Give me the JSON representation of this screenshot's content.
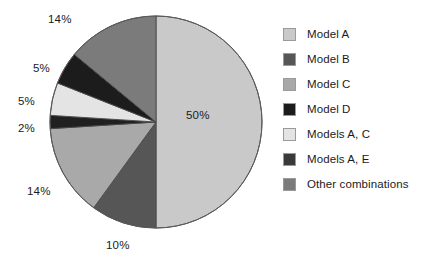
{
  "chart_data": {
    "type": "pie",
    "title": "",
    "subtitle": "",
    "xlabel": "",
    "ylabel": "",
    "grid": false,
    "legend_position": "right",
    "start_angle_deg": 0,
    "direction": "clockwise",
    "categories": [
      "Model A",
      "Model B",
      "Model C",
      "Models A, E",
      "Models A, C",
      "Model D",
      "Other combinations"
    ],
    "values": [
      50,
      10,
      14,
      2,
      5,
      5,
      14
    ],
    "data_labels": [
      "50%",
      "10%",
      "14%",
      "2%",
      "5%",
      "5%",
      "14%"
    ],
    "colors": [
      "#c9c9c9",
      "#565656",
      "#a9a9a9",
      "#202020",
      "#e4e4e4",
      "#1c1c1c",
      "#7b7b7b"
    ],
    "slices": [
      {
        "label": "Model A",
        "value": 50,
        "display": "50%",
        "color": "#c9c9c9"
      },
      {
        "label": "Model B",
        "value": 10,
        "display": "10%",
        "color": "#565656"
      },
      {
        "label": "Model C",
        "value": 14,
        "display": "14%",
        "color": "#a9a9a9"
      },
      {
        "label": "Models A, E",
        "value": 2,
        "display": "2%",
        "color": "#202020"
      },
      {
        "label": "Models A, C",
        "value": 5,
        "display": "5%",
        "color": "#e4e4e4"
      },
      {
        "label": "Model D",
        "value": 5,
        "display": "5%",
        "color": "#1c1c1c"
      },
      {
        "label": "Other combinations",
        "value": 14,
        "display": "14%",
        "color": "#7b7b7b"
      }
    ]
  },
  "legend": {
    "items": [
      {
        "label": "Model A",
        "color": "#c9c9c9"
      },
      {
        "label": "Model B",
        "color": "#565656"
      },
      {
        "label": "Model C",
        "color": "#a9a9a9"
      },
      {
        "label": "Model D",
        "color": "#1c1c1c"
      },
      {
        "label": "Models A, C",
        "color": "#e4e4e4"
      },
      {
        "label": "Models A, E",
        "color": "#3a3a3a"
      },
      {
        "label": "Other combinations",
        "color": "#7b7b7b"
      }
    ]
  },
  "labels": {
    "top_14": "14%",
    "upper_5": "5%",
    "mid_5": "5%",
    "left_2": "2%",
    "lower_14": "14%",
    "bottom_10": "10%",
    "center_50": "50%"
  }
}
